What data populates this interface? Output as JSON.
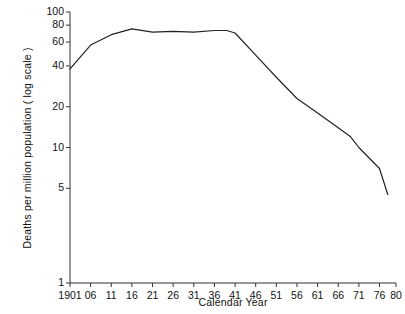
{
  "chart_data": {
    "type": "line",
    "title": "",
    "xlabel": "Calendar Year",
    "ylabel": "Deaths per million population ( log scale )",
    "yscale": "log",
    "ylim": [
      1,
      100
    ],
    "xlim": [
      1901,
      1980
    ],
    "grid": false,
    "legend": null,
    "yticks": [
      1,
      5,
      10,
      20,
      40,
      60,
      80,
      100
    ],
    "ytick_labels": [
      "1",
      "5",
      "10",
      "20",
      "40",
      "60",
      "80",
      "100"
    ],
    "xticks": [
      1901,
      1906,
      1911,
      1916,
      1921,
      1926,
      1931,
      1936,
      1941,
      1946,
      1951,
      1956,
      1961,
      1966,
      1971,
      1976,
      1980
    ],
    "xtick_labels": [
      "1901",
      "06",
      "11",
      "16",
      "21",
      "26",
      "31",
      "36",
      "41",
      "46",
      "51",
      "56",
      "61",
      "66",
      "71",
      "76",
      "80"
    ],
    "series": [
      {
        "name": "Deaths per million population",
        "x": [
          1901,
          1906,
          1911,
          1916,
          1921,
          1926,
          1931,
          1936,
          1939,
          1941,
          1946,
          1951,
          1956,
          1961,
          1966,
          1969,
          1971,
          1976,
          1978
        ],
        "values": [
          38,
          57,
          68,
          75,
          71,
          72,
          71,
          73,
          73,
          70,
          48,
          33,
          23,
          18,
          14,
          12,
          10,
          7,
          4.5
        ]
      }
    ],
    "line_color": "#222222",
    "axis_color": "#333333"
  },
  "axes": {
    "y_title": "Deaths per million population ( log scale )",
    "x_title": "Calendar Year"
  }
}
